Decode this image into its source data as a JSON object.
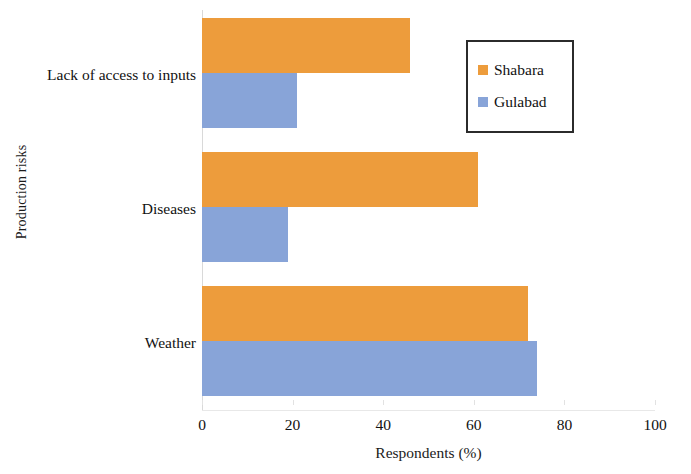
{
  "chart_data": {
    "type": "bar",
    "orientation": "horizontal",
    "title": "",
    "xlabel": "Respondents (%)",
    "ylabel": "Production risks",
    "categories": [
      "Lack of access to inputs",
      "Diseases",
      "Weather"
    ],
    "series": [
      {
        "name": "Shabara",
        "color": "#ed9c3c",
        "values": [
          46,
          61,
          72
        ]
      },
      {
        "name": "Gulabad",
        "color": "#88a4d8",
        "values": [
          21,
          19,
          74
        ]
      }
    ],
    "xlim": [
      0,
      100
    ],
    "xticks": [
      0,
      20,
      40,
      60,
      80,
      100
    ],
    "xtick_labels": [
      "0",
      "20",
      "40",
      "60",
      "80",
      "100"
    ],
    "grid": false,
    "legend_position": "top-right",
    "legend_entries": [
      "Shabara",
      "Gulabad"
    ]
  },
  "axes": {
    "x_title": "Respondents (%)",
    "y_title": "Production risks"
  },
  "categories": [
    {
      "label": "Lack of access to inputs"
    },
    {
      "label": "Diseases"
    },
    {
      "label": "Weather"
    }
  ],
  "xticks": [
    {
      "label": "0"
    },
    {
      "label": "20"
    },
    {
      "label": "40"
    },
    {
      "label": "60"
    },
    {
      "label": "80"
    },
    {
      "label": "100"
    }
  ],
  "legend": {
    "items": [
      {
        "label": "Shabara",
        "color": "#ed9c3c"
      },
      {
        "label": "Gulabad",
        "color": "#88a4d8"
      }
    ]
  }
}
